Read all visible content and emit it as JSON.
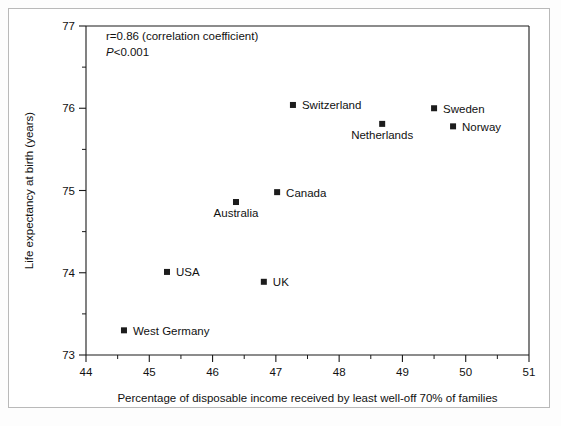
{
  "chart_data": {
    "type": "scatter",
    "title": "",
    "xlabel": "Percentage of disposable income received by least well-off 70% of families",
    "ylabel": "Life expectancy at birth (years)",
    "xlim": [
      44,
      51
    ],
    "ylim": [
      73,
      77
    ],
    "xticks": [
      44,
      45,
      46,
      47,
      48,
      49,
      50,
      51
    ],
    "xtick_labels": [
      "44",
      "45",
      "46",
      "47",
      "48",
      "49",
      "50",
      "51"
    ],
    "yticks": [
      73,
      74,
      75,
      76,
      77
    ],
    "ytick_labels": [
      "73",
      "74",
      "75",
      "76",
      "77"
    ],
    "minor_tick_step_x": 0.5,
    "minor_tick_step_y": 0.5,
    "grid": false,
    "legend": "none",
    "marker": "square",
    "marker_color": "#1c1c1c",
    "points": [
      {
        "label": "Switzerland",
        "x": 47.27,
        "y": 76.04,
        "label_pos": "right"
      },
      {
        "label": "Sweden",
        "x": 49.5,
        "y": 76.0,
        "label_pos": "right"
      },
      {
        "label": "Norway",
        "x": 49.8,
        "y": 75.78,
        "label_pos": "right"
      },
      {
        "label": "Netherlands",
        "x": 48.68,
        "y": 75.81,
        "label_pos": "below"
      },
      {
        "label": "Canada",
        "x": 47.02,
        "y": 74.98,
        "label_pos": "right"
      },
      {
        "label": "Australia",
        "x": 46.37,
        "y": 74.86,
        "label_pos": "below"
      },
      {
        "label": "USA",
        "x": 45.28,
        "y": 74.01,
        "label_pos": "right"
      },
      {
        "label": "UK",
        "x": 46.81,
        "y": 73.89,
        "label_pos": "right"
      },
      {
        "label": "West Germany",
        "x": 44.6,
        "y": 73.3,
        "label_pos": "right"
      }
    ],
    "annotations": [
      {
        "name": "correlation-coefficient",
        "text": "r=0.86 (correlation coefficient)",
        "style": "normal"
      },
      {
        "name": "p-value",
        "text_prefix": "P",
        "text_suffix": "<0.001",
        "style": "italic-prefix"
      }
    ]
  },
  "annotation_lines": {
    "line1": "r=0.86 (correlation coefficient)",
    "line2_prefix": "P",
    "line2_suffix": "<0.001"
  },
  "colors": {
    "marker": "#1c1c1c",
    "axis": "#1a1a1a",
    "text": "#111111",
    "outer_border": "#b9b9b9",
    "plot_background": "#ffffff"
  }
}
